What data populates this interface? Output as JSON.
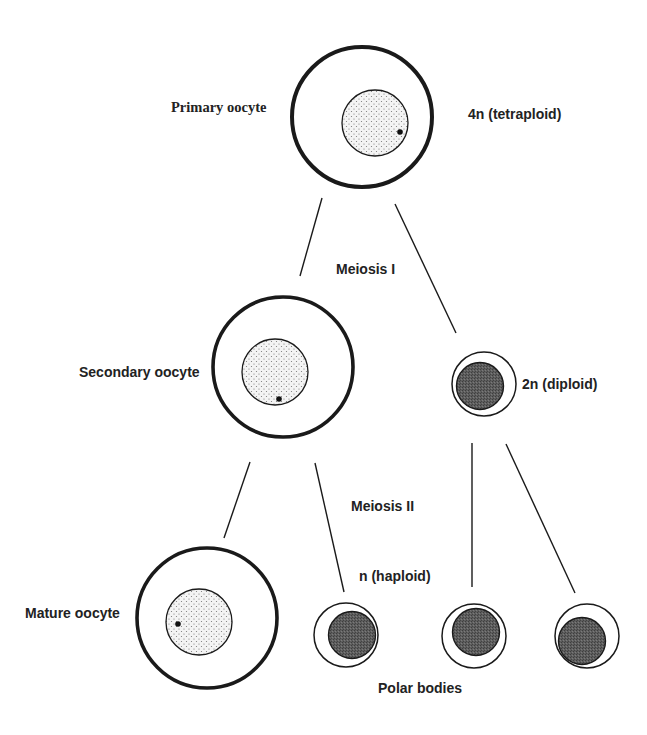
{
  "diagram": {
    "colors": {
      "background": "#ffffff",
      "stroke": "#1a1a1a",
      "nucleus_fill": "#f2f2f2",
      "stipple": "#777777",
      "polar_body_fill": "#5a5a5a"
    },
    "labels": {
      "primary_oocyte": "Primary oocyte",
      "tetraploid": "4n (tetraploid)",
      "meiosis_1": "Meiosis I",
      "secondary_oocyte": "Secondary oocyte",
      "diploid": "2n (diploid)",
      "meiosis_2": "Meiosis II",
      "haploid": "n (haploid)",
      "mature_oocyte": "Mature oocyte",
      "polar_bodies": "Polar bodies"
    },
    "nodes": [
      {
        "id": "primary-oocyte",
        "type": "oocyte",
        "ploidy": "4n"
      },
      {
        "id": "secondary-oocyte",
        "type": "oocyte",
        "ploidy": "2n"
      },
      {
        "id": "first-polar-body",
        "type": "polar-body",
        "ploidy": "2n"
      },
      {
        "id": "mature-oocyte",
        "type": "oocyte",
        "ploidy": "n"
      },
      {
        "id": "polar-body-1",
        "type": "polar-body",
        "ploidy": "n"
      },
      {
        "id": "polar-body-2",
        "type": "polar-body",
        "ploidy": "n"
      },
      {
        "id": "polar-body-3",
        "type": "polar-body",
        "ploidy": "n"
      }
    ],
    "edges": [
      {
        "from": "primary-oocyte",
        "to": "secondary-oocyte",
        "stage": "Meiosis I"
      },
      {
        "from": "primary-oocyte",
        "to": "first-polar-body",
        "stage": "Meiosis I"
      },
      {
        "from": "secondary-oocyte",
        "to": "mature-oocyte",
        "stage": "Meiosis II"
      },
      {
        "from": "secondary-oocyte",
        "to": "polar-body-1",
        "stage": "Meiosis II"
      },
      {
        "from": "first-polar-body",
        "to": "polar-body-2",
        "stage": "Meiosis II"
      },
      {
        "from": "first-polar-body",
        "to": "polar-body-3",
        "stage": "Meiosis II"
      }
    ]
  }
}
